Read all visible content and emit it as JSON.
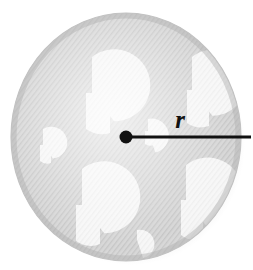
{
  "figure": {
    "name": "circle-radius-diagram",
    "background_color": "#ffffff"
  },
  "disc": {
    "name": "shaded-disc",
    "center_x": 126,
    "center_y": 137,
    "radius_x": 115,
    "radius_y": 124,
    "fill_color": "#d2d2d2",
    "highlight_color": "#e8e8e8",
    "edge_shadow_color": "#b6b6b6",
    "outline_color": "#bdbdbd",
    "texture": "diagonal-hatch"
  },
  "motifs": {
    "name": "umbrella-motifs",
    "fill_color": "#f6f6f6",
    "count": 6,
    "shapes": [
      {
        "id": "motif-top-center",
        "cx": 92,
        "cy": 93,
        "r": 36,
        "notch_angle": 52
      },
      {
        "id": "motif-top-right",
        "cx": 192,
        "cy": 90,
        "r": 33,
        "notch_angle": 52
      },
      {
        "id": "motif-left",
        "cx": 43,
        "cy": 145,
        "r": 16,
        "notch_angle": 52
      },
      {
        "id": "motif-bottom-left",
        "cx": 82,
        "cy": 205,
        "r": 36,
        "notch_angle": 52
      },
      {
        "id": "motif-bottom-right",
        "cx": 186,
        "cy": 200,
        "r": 35,
        "notch_angle": 52
      },
      {
        "id": "motif-center-small",
        "cx": 148,
        "cy": 131,
        "r": 12,
        "notch_angle": 52
      }
    ]
  },
  "center_point": {
    "name": "center-dot",
    "x": 126,
    "y": 137,
    "radius": 6.5,
    "color": "#111111"
  },
  "radius_segment": {
    "name": "radius-line",
    "x1": 126,
    "y1": 137,
    "x2": 251,
    "y2": 137,
    "stroke_width": 3.2,
    "color": "#111111"
  },
  "labels": {
    "radius": {
      "name": "radius-label",
      "text": "r",
      "x": 180,
      "y": 128,
      "color": "#111111",
      "style": "italic-serif"
    }
  }
}
